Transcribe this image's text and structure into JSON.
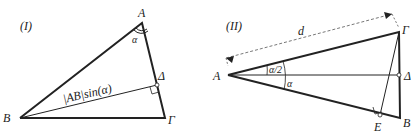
{
  "figure1": {
    "label": "(I)",
    "points": {
      "A": "A",
      "B": "B",
      "G": "Γ",
      "D": "Δ"
    },
    "angle": "α",
    "segment_label": "|AB|sin(α)"
  },
  "figure2": {
    "label": "(II)",
    "points": {
      "A": "A",
      "B": "B",
      "G": "Γ",
      "D": "Δ",
      "E": "E"
    },
    "half_angle": "α/2",
    "angle": "α",
    "distance": "d"
  },
  "colors": {
    "line": "#222222",
    "dashed": "#555555"
  }
}
